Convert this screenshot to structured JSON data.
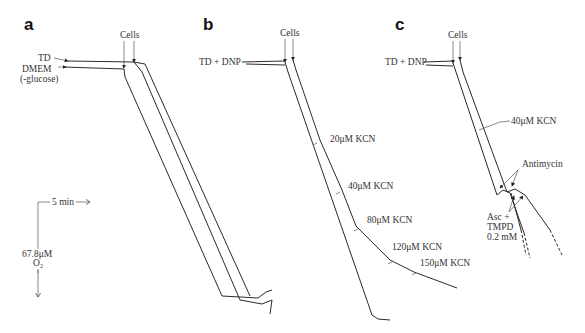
{
  "figure": {
    "panels": [
      {
        "id": "a",
        "label": "a",
        "cells_label": "Cells",
        "traces": [
          "TD",
          "DMEM"
        ],
        "trace_label_td": "TD",
        "trace_label_dmem": "DMEM",
        "trace_label_dmem_sub": "(-glucose)"
      },
      {
        "id": "b",
        "label": "b",
        "cells_label": "Cells",
        "trace_label": "TD + DNP",
        "additions": [
          "20μM  KCN",
          "40μM  KCN",
          "80μM  KCN",
          "120μM  KCN",
          "150μM  KCN"
        ]
      },
      {
        "id": "c",
        "label": "c",
        "cells_label": "Cells",
        "trace_label": "TD + DNP",
        "kcn_label": "40μM  KCN",
        "antimycin_label": "Antimycin",
        "asc_label_1": "Asc  +",
        "asc_label_2": "TMPD",
        "asc_label_3": "0.2 mM"
      }
    ],
    "scale": {
      "time_label": "5 min",
      "oxygen_label": "67.8μM",
      "oxygen_unit": "O",
      "oxygen_sub": "2"
    }
  }
}
